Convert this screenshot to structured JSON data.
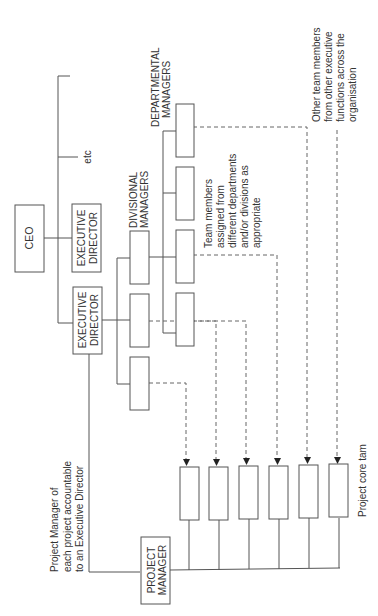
{
  "diagram": {
    "orientation": "rotated-90-ccw",
    "nodes": {
      "ceo": "CEO",
      "exec_director_1_line1": "EXECUTIVE",
      "exec_director_1_line2": "DIRECTOR",
      "exec_director_2_line1": "EXECUTIVE",
      "exec_director_2_line2": "DIRECTOR",
      "etc": "etc",
      "project_manager_line1": "PROJECT",
      "project_manager_line2": "MANAGER"
    },
    "group_labels": {
      "divisional_line1": "DIVISIONAL",
      "divisional_line2": "MANAGERS",
      "departmental_line1": "DEPARTMENTAL",
      "departmental_line2": "MANAGERS",
      "project_core_team": "Project core tam"
    },
    "annotations": {
      "pm_note": [
        "Project Manager of",
        "each project accountable",
        "to an Executive Director"
      ],
      "team_note": [
        "Team members",
        "assigned from",
        "different departments",
        "and/or divisions as",
        "appropriate"
      ],
      "other_note": [
        "Other team members",
        "from other executive",
        "functions across the",
        "organisation"
      ]
    },
    "counts": {
      "divisional_manager_boxes": 3,
      "departmental_manager_boxes": 4,
      "project_core_team_boxes": 6
    },
    "colors": {
      "line": "#555555",
      "text": "#333333",
      "background": "#ffffff"
    }
  }
}
